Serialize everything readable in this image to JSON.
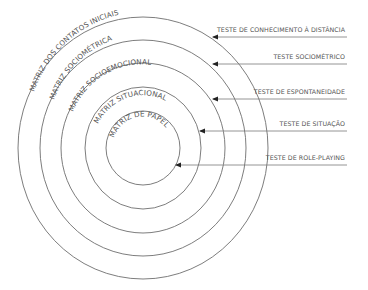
{
  "diagram": {
    "type": "concentric-circles",
    "center": {
      "x": 143,
      "y": 148
    },
    "rings": [
      {
        "label": "MATRIZ DOS CONTATOS INICIAIS",
        "rx": 125,
        "ry": 131
      },
      {
        "label": "MATRIZ SOCIOMÉTRICA",
        "rx": 103,
        "ry": 108
      },
      {
        "label": "MATRIZ SOCIOEMOCIONAL",
        "rx": 82,
        "ry": 85
      },
      {
        "label": "MATRIZ SITUACIONAL",
        "rx": 58,
        "ry": 61
      },
      {
        "label": "MATRIZ DE PAPEL",
        "rx": 37,
        "ry": 37
      }
    ],
    "tests": [
      {
        "label": "TESTE DE CONHECIMENTO À DISTÂNCIA",
        "target_ring": "MATRIZ DOS CONTATOS INICIAIS"
      },
      {
        "label": "TESTE SOCIOMÉTRICO",
        "target_ring": "MATRIZ SOCIOMÉTRICA"
      },
      {
        "label": "TESTE DE ESPONTANEIDADE",
        "target_ring": "MATRIZ SOCIOEMOCIONAL"
      },
      {
        "label": "TESTE DE SITUAÇÃO",
        "target_ring": "MATRIZ SITUACIONAL"
      },
      {
        "label": "TESTE DE ROLE-PLAYING",
        "target_ring": "MATRIZ DE PAPEL"
      }
    ],
    "colors": {
      "ring": "#6e6e6e",
      "text": "#555555",
      "arrow": "#222222",
      "background": "#ffffff"
    }
  }
}
